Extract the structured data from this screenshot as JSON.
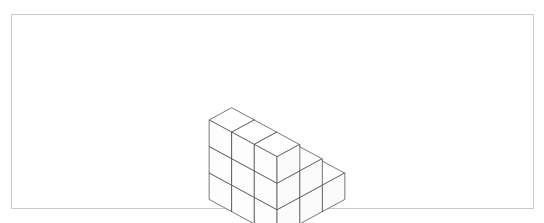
{
  "canvas": {
    "width": 544,
    "height": 223,
    "background_color": "#ffffff"
  },
  "frame": {
    "name": "figure-border",
    "x": 11,
    "y": 14,
    "width": 523,
    "height": 195,
    "border_color": "#c9c9c9",
    "border_width": 1,
    "fill_color": "#ffffff"
  },
  "figure": {
    "title": "",
    "caption": "",
    "kind": "isometric-cube-stack",
    "line_color": "#555555",
    "line_width": 0.8,
    "face_color": "#ffffff",
    "bounds": {
      "left": 208,
      "top": 29,
      "right": 346,
      "bottom": 187
    },
    "projection": {
      "origin_x": 277,
      "origin_y": 163,
      "half_width": 22.5,
      "half_depth": 12.2,
      "cube_height": 26.5
    },
    "cube_count": 18,
    "cubes": [
      {
        "x": 0,
        "y": 0,
        "z": 0
      },
      {
        "x": 1,
        "y": 0,
        "z": 0
      },
      {
        "x": 2,
        "y": 0,
        "z": 0
      },
      {
        "x": 0,
        "y": 1,
        "z": 0
      },
      {
        "x": 1,
        "y": 1,
        "z": 0
      },
      {
        "x": 2,
        "y": 1,
        "z": 0
      },
      {
        "x": 0,
        "y": 2,
        "z": 0
      },
      {
        "x": 1,
        "y": 2,
        "z": 0
      },
      {
        "x": 2,
        "y": 2,
        "z": 0
      },
      {
        "x": 0,
        "y": 1,
        "z": 1
      },
      {
        "x": 1,
        "y": 1,
        "z": 1
      },
      {
        "x": 2,
        "y": 1,
        "z": 1
      },
      {
        "x": 0,
        "y": 2,
        "z": 1
      },
      {
        "x": 1,
        "y": 2,
        "z": 1
      },
      {
        "x": 2,
        "y": 2,
        "z": 1
      },
      {
        "x": 0,
        "y": 2,
        "z": 2
      },
      {
        "x": 1,
        "y": 2,
        "z": 2
      },
      {
        "x": 2,
        "y": 2,
        "z": 2
      }
    ],
    "column_heights": [
      {
        "column": "front-left",
        "height": 1
      },
      {
        "column": "front-center",
        "height": 1
      },
      {
        "column": "front-right",
        "height": 1
      },
      {
        "column": "mid-left",
        "height": 2
      },
      {
        "column": "mid-center",
        "height": 2
      },
      {
        "column": "mid-right",
        "height": 2
      },
      {
        "column": "back-left",
        "height": 3
      },
      {
        "column": "back-center",
        "height": 3
      },
      {
        "column": "back-right",
        "height": 3
      }
    ]
  }
}
